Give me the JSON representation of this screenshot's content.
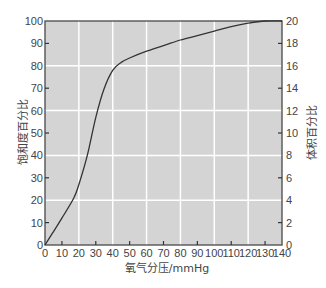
{
  "chart_data": {
    "type": "line",
    "title": "",
    "xlabel": "氧气分压/mmHg",
    "ylabel": "饱和度百分比",
    "ylabel_right": "体积百分比",
    "xlim": [
      0,
      140
    ],
    "ylim": [
      0,
      100
    ],
    "ylim_right": [
      0,
      20
    ],
    "grid": true,
    "x_ticks": [
      0,
      10,
      20,
      30,
      40,
      50,
      60,
      70,
      80,
      90,
      100,
      110,
      120,
      130,
      140
    ],
    "y_ticks": [
      0,
      10,
      20,
      30,
      40,
      50,
      60,
      70,
      80,
      90,
      100
    ],
    "y_right_ticks": [
      0,
      2,
      4,
      6,
      8,
      10,
      12,
      14,
      16,
      18,
      20
    ],
    "x_grid": [
      20,
      40,
      60,
      80,
      100,
      120
    ],
    "y_grid": [
      20,
      40,
      60,
      80
    ],
    "series": [
      {
        "name": "氧合血红蛋白解离曲线",
        "x": [
          0,
          5,
          10,
          17,
          20,
          25,
          30,
          35,
          40,
          45,
          50,
          60,
          70,
          80,
          90,
          100,
          110,
          120,
          130,
          140
        ],
        "values": [
          0,
          6,
          12,
          21,
          27,
          40,
          57,
          70,
          78,
          81.5,
          83.5,
          86.5,
          89,
          91.5,
          93.5,
          95.5,
          97.5,
          99,
          100,
          100
        ]
      }
    ],
    "colors": {
      "plot_bg": "#d4d4d4",
      "grid": "#ffffff",
      "curve": "#333333",
      "axis": "#555555"
    }
  }
}
